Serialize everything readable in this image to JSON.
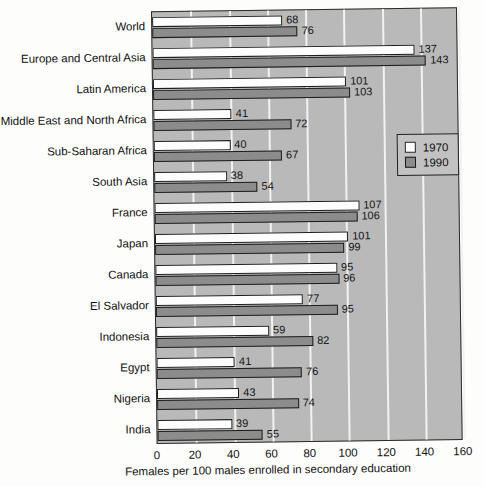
{
  "chart_data": {
    "type": "bar",
    "orientation": "horizontal",
    "title": "",
    "xlabel": "Females per 100 males enrolled in secondary education",
    "ylabel": "",
    "xlim": [
      0,
      160
    ],
    "xticks": [
      0,
      20,
      40,
      60,
      80,
      100,
      120,
      140,
      160
    ],
    "grid": true,
    "legend_position": "middle-right",
    "categories": [
      "World",
      "Europe and Central Asia",
      "Latin America",
      "Middle East and North Africa",
      "Sub-Saharan Africa",
      "South Asia",
      "France",
      "Japan",
      "Canada",
      "El Salvador",
      "Indonesia",
      "Egypt",
      "Nigeria",
      "India"
    ],
    "series": [
      {
        "name": "1970",
        "color": "#ffffff",
        "values": [
          68,
          137,
          101,
          41,
          40,
          38,
          107,
          101,
          95,
          77,
          59,
          41,
          43,
          39
        ]
      },
      {
        "name": "1990",
        "color": "#8c8c8c",
        "values": [
          76,
          143,
          103,
          72,
          67,
          54,
          106,
          99,
          96,
          95,
          82,
          76,
          74,
          55
        ]
      }
    ]
  },
  "legend": {
    "entries": [
      {
        "label": "1970",
        "swatch": "white-square-icon"
      },
      {
        "label": "1990",
        "swatch": "gray-square-icon"
      }
    ]
  },
  "colors": {
    "plot_background": "#b9b9b9",
    "gridline": "#f2f2f2",
    "bar_1970": "#ffffff",
    "bar_1990": "#8c8c8c",
    "axis": "#2b2b2b",
    "page_background": "#fdfdfb"
  }
}
